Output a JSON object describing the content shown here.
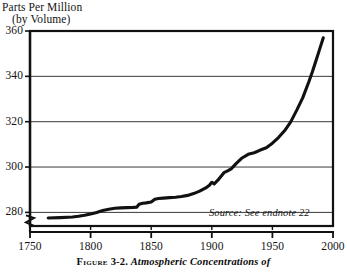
{
  "axis_title": {
    "line1": "Parts Per Million",
    "line2": "(by Volume)"
  },
  "source_note": "Source: See endnote 22",
  "caption": {
    "label": "Figure",
    "number": "3-2.",
    "text": "Atmospheric Concentrations of"
  },
  "colors": {
    "line": "#111111",
    "frame": "#111111",
    "grid": "#3a3a3a",
    "background": "#ffffff",
    "text": "#141414"
  },
  "chart_data": {
    "type": "line",
    "title": "Parts Per Million (by Volume)",
    "xlabel": "",
    "ylabel": "Parts Per Million (by Volume)",
    "xlim": [
      1750,
      2000
    ],
    "ylim": [
      274,
      360
    ],
    "y_axis_break": true,
    "y_axis_break_below": 280,
    "grid": true,
    "grid_axis": "y",
    "legend": false,
    "xticks": [
      1750,
      1800,
      1850,
      1900,
      1950,
      2000
    ],
    "yticks": [
      280,
      300,
      320,
      340,
      360
    ],
    "annotations": [
      "Source: See endnote 22"
    ],
    "series": [
      {
        "name": "Atmospheric CO2 concentration",
        "x": [
          1765,
          1775,
          1785,
          1790,
          1795,
          1800,
          1805,
          1810,
          1815,
          1820,
          1825,
          1830,
          1835,
          1838,
          1840,
          1843,
          1846,
          1850,
          1853,
          1856,
          1860,
          1865,
          1870,
          1875,
          1880,
          1885,
          1890,
          1895,
          1898,
          1900,
          1902,
          1905,
          1908,
          1910,
          1913,
          1916,
          1920,
          1925,
          1930,
          1935,
          1940,
          1945,
          1950,
          1955,
          1960,
          1965,
          1970,
          1975,
          1980,
          1983,
          1986,
          1989,
          1992
        ],
        "y": [
          277.5,
          277.7,
          278.0,
          278.3,
          278.7,
          279.3,
          280.0,
          280.8,
          281.4,
          281.8,
          282.0,
          282.1,
          282.2,
          282.3,
          283.6,
          284.0,
          284.2,
          284.6,
          285.8,
          286.1,
          286.3,
          286.5,
          286.7,
          287.0,
          287.5,
          288.3,
          289.4,
          290.8,
          292.0,
          293.3,
          292.6,
          294.2,
          296.2,
          297.5,
          298.3,
          299.2,
          301.5,
          304.0,
          305.6,
          306.3,
          307.5,
          308.5,
          310.5,
          313.0,
          316.0,
          319.8,
          325.0,
          330.5,
          337.5,
          342.0,
          347.0,
          352.0,
          357.0
        ]
      }
    ]
  },
  "geometry": {
    "plot_left": 30,
    "plot_right": 333,
    "plot_top": 31,
    "plot_bottom": 226,
    "y_value_top": 360,
    "y_value_bottom": 274,
    "x_value_left": 1750,
    "x_value_right": 2000
  }
}
